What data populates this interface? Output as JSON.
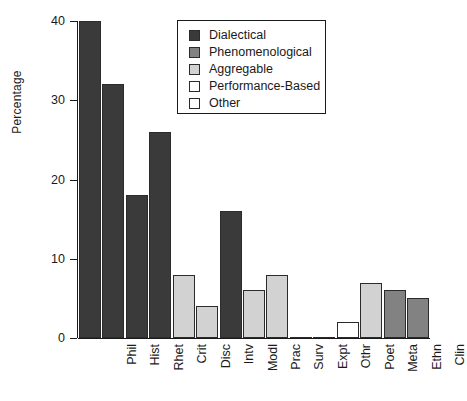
{
  "chart_data": {
    "type": "bar",
    "title": "",
    "xlabel": "",
    "ylabel": "Percentage",
    "ylim": [
      0,
      40
    ],
    "yticks": [
      0,
      10,
      20,
      30,
      40
    ],
    "ytick_labels": [
      "0",
      "10",
      "20",
      "30",
      "40"
    ],
    "grid": false,
    "legend_position": "top-center",
    "categories": [
      "Phil",
      "Hist",
      "Rhet",
      "Crit",
      "Disc",
      "Intv",
      "Modl",
      "Prac",
      "Surv",
      "Expt",
      "Othr",
      "Poet",
      "Meta",
      "Ethn",
      "Clin"
    ],
    "values": [
      40,
      32,
      18,
      26,
      8,
      4,
      16,
      6,
      8,
      0,
      0,
      2,
      7,
      6,
      5
    ],
    "bar_groups": [
      "Dialectical",
      "Dialectical",
      "Dialectical",
      "Dialectical",
      "Aggregable",
      "Aggregable",
      "Dialectical",
      "Aggregable",
      "Aggregable",
      "Performance-Based",
      "Other",
      "Performance-Based",
      "Aggregable",
      "Phenomenological",
      "Phenomenological"
    ],
    "bar_colors": [
      "#3a3a3a",
      "#3a3a3a",
      "#3a3a3a",
      "#3a3a3a",
      "#d2d2d2",
      "#d2d2d2",
      "#3a3a3a",
      "#d2d2d2",
      "#d2d2d2",
      "#ffffff",
      "#ffffff",
      "#ffffff",
      "#d2d2d2",
      "#828282",
      "#828282"
    ],
    "legend": [
      {
        "label": "Dialectical",
        "color": "#3a3a3a"
      },
      {
        "label": "Phenomenological",
        "color": "#828282"
      },
      {
        "label": "Aggregable",
        "color": "#d2d2d2"
      },
      {
        "label": "Performance-Based",
        "color": "#ffffff"
      },
      {
        "label": "Other",
        "color": "#ffffff"
      }
    ]
  }
}
